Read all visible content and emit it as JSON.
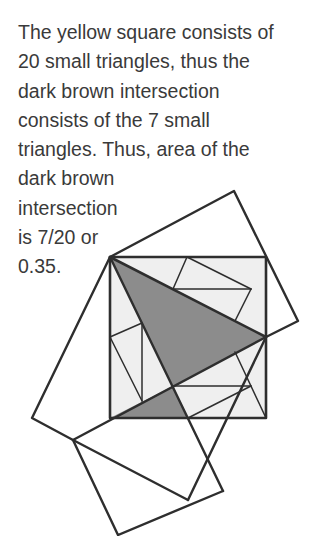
{
  "explanation": {
    "lines": [
      "The yellow square consists of",
      "20 small triangles, thus the",
      "dark brown intersection",
      "consists of the 7 small",
      "triangles. Thus, area of the",
      "dark brown",
      "intersection",
      "is 7/20 or",
      "0.35."
    ]
  },
  "diagram": {
    "colors": {
      "stroke": "#2e2e2e",
      "square_fill": "#efefef",
      "intersection_fill": "#8c8c8c",
      "background": "#ffffff"
    },
    "inner_square_label": "yellow square",
    "intersection_label": "dark brown intersection",
    "total_small_triangles": 20,
    "intersection_small_triangles": 7,
    "intersection_area": "7/20",
    "intersection_area_decimal": "0.35"
  }
}
